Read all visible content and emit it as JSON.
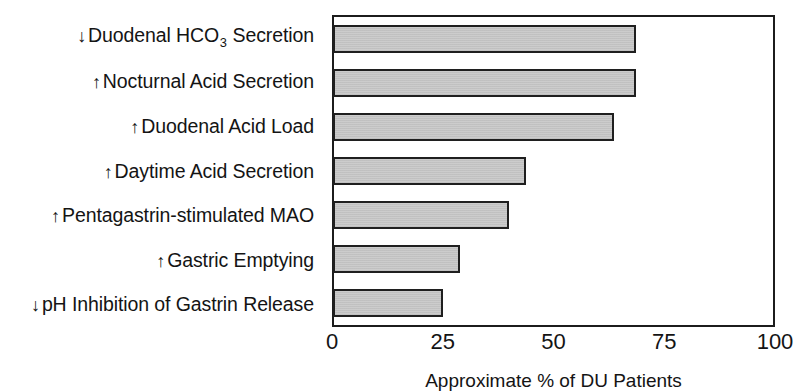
{
  "chart_data": {
    "type": "bar",
    "orientation": "horizontal",
    "title": "",
    "xlabel": "Approximate % of DU Patients",
    "ylabel": "",
    "xlim": [
      0,
      100
    ],
    "xticks": [
      0,
      25,
      50,
      75,
      100
    ],
    "xtick_labels": [
      "0",
      "25",
      "50",
      "75",
      "100"
    ],
    "grid": false,
    "legend": false,
    "bar_color": "#c9c9c9",
    "bar_edge_color": "#1f1f1f",
    "categories": [
      "↓ Duodenal HCO3 Secretion",
      "↑ Nocturnal Acid Secretion",
      "↑ Duodenal Acid Load",
      "↑ Daytime Acid Secretion",
      "↑ Pentagastrin-stimulated MAO",
      "↑ Gastric Emptying",
      "↓ pH Inhibition of Gastrin Release"
    ],
    "values": [
      69,
      69,
      64,
      44,
      40,
      29,
      25
    ]
  },
  "axis": {
    "caption": "Approximate % of DU Patients",
    "ticks": [
      {
        "label": "0",
        "value": 0
      },
      {
        "label": "25",
        "value": 25
      },
      {
        "label": "50",
        "value": 50
      },
      {
        "label": "75",
        "value": 75
      },
      {
        "label": "100",
        "value": 100
      }
    ]
  },
  "rows": [
    {
      "arrow": "↓",
      "text_before": "Duodenal HCO",
      "sub": "3",
      "text_after": " Secretion",
      "value": 69
    },
    {
      "arrow": "↑",
      "text_before": "Nocturnal Acid Secretion",
      "sub": "",
      "text_after": "",
      "value": 69
    },
    {
      "arrow": "↑",
      "text_before": "Duodenal Acid Load",
      "sub": "",
      "text_after": "",
      "value": 64
    },
    {
      "arrow": "↑",
      "text_before": "Daytime Acid Secretion",
      "sub": "",
      "text_after": "",
      "value": 44
    },
    {
      "arrow": "↑",
      "text_before": "Pentagastrin-stimulated MAO",
      "sub": "",
      "text_after": "",
      "value": 40
    },
    {
      "arrow": "↑",
      "text_before": "Gastric Emptying",
      "sub": "",
      "text_after": "",
      "value": 29
    },
    {
      "arrow": "↓",
      "text_before": "pH Inhibition of Gastrin Release",
      "sub": "",
      "text_after": "",
      "value": 25
    }
  ]
}
